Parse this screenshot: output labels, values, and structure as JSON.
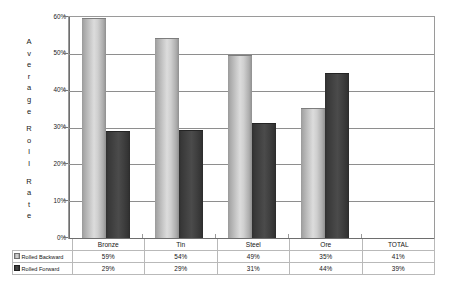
{
  "chart_data": {
    "type": "bar",
    "title": "",
    "xlabel": "",
    "ylabel": "Average Roll Rate",
    "ylim": [
      0,
      60
    ],
    "ytick_labels": [
      "0%",
      "10%",
      "20%",
      "30%",
      "40%",
      "50%",
      "60%"
    ],
    "ytick_values": [
      0,
      10,
      20,
      30,
      40,
      50,
      60
    ],
    "grid": true,
    "legend_position": "table-row-headers",
    "categories": [
      "Bronze",
      "Tin",
      "Steel",
      "Ore",
      "TOTAL"
    ],
    "plotted_categories": [
      "Bronze",
      "Tin",
      "Steel",
      "Ore"
    ],
    "series": [
      {
        "name": "Rolled Backward",
        "color": "#d0d0d0",
        "values": [
          59,
          54,
          49,
          35,
          41
        ],
        "plotted_values": [
          59.5,
          54,
          49.5,
          35
        ],
        "labels": [
          "59%",
          "54%",
          "49%",
          "35%",
          "41%"
        ]
      },
      {
        "name": "Rolled Forward",
        "color": "#3f3f3f",
        "values": [
          29,
          29,
          31,
          44,
          39
        ],
        "plotted_values": [
          28.8,
          29,
          31,
          44.5
        ],
        "labels": [
          "29%",
          "29%",
          "31%",
          "44%",
          "39%"
        ]
      }
    ]
  },
  "axis": {
    "y_title_lines": [
      "A",
      "v",
      "e",
      "r",
      "a",
      "g",
      "e",
      "",
      "R",
      "o",
      "l",
      "l",
      "",
      "R",
      "a",
      "t",
      "e"
    ]
  },
  "table": {
    "corner": "",
    "header_labels": [
      "Bronze",
      "Tin",
      "Steel",
      "Ore",
      "TOTAL"
    ],
    "rows": [
      {
        "label": "Rolled Backward",
        "swatch": "light",
        "cells": [
          "59%",
          "54%",
          "49%",
          "35%",
          "41%"
        ]
      },
      {
        "label": "Rolled Forward",
        "swatch": "dark",
        "cells": [
          "29%",
          "29%",
          "31%",
          "44%",
          "39%"
        ]
      }
    ]
  },
  "colors": {
    "bar_light": "#d0d0d0",
    "bar_dark": "#3f3f3f",
    "gridline": "#8e8e8e",
    "frame": "#9a9a9a",
    "table_border": "#b9b9b9",
    "text": "#161616"
  }
}
